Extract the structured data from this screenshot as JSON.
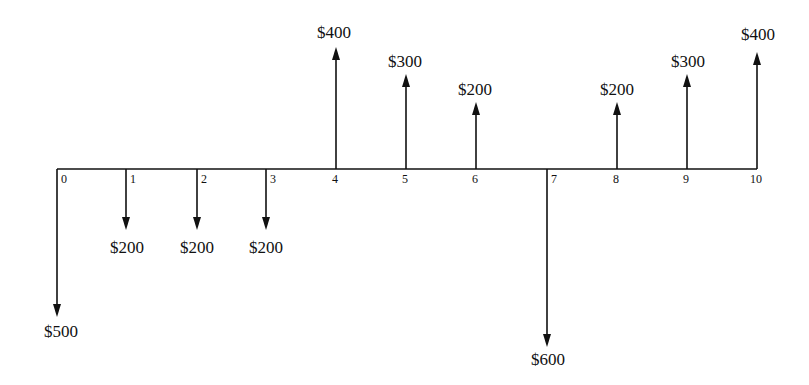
{
  "diagram": {
    "type": "cash-flow-diagram",
    "axis": {
      "periods": [
        "0",
        "1",
        "2",
        "3",
        "4",
        "5",
        "6",
        "7",
        "8",
        "9",
        "10"
      ]
    },
    "cash_flows": [
      {
        "period": 0,
        "direction": "down",
        "label": "$500"
      },
      {
        "period": 1,
        "direction": "down",
        "label": "$200"
      },
      {
        "period": 2,
        "direction": "down",
        "label": "$200"
      },
      {
        "period": 3,
        "direction": "down",
        "label": "$200"
      },
      {
        "period": 4,
        "direction": "up",
        "label": "$400"
      },
      {
        "period": 5,
        "direction": "up",
        "label": "$300"
      },
      {
        "period": 6,
        "direction": "up",
        "label": "$200"
      },
      {
        "period": 7,
        "direction": "down",
        "label": "$600"
      },
      {
        "period": 8,
        "direction": "up",
        "label": "$200"
      },
      {
        "period": 9,
        "direction": "up",
        "label": "$300"
      },
      {
        "period": 10,
        "direction": "up",
        "label": "$400"
      }
    ]
  }
}
